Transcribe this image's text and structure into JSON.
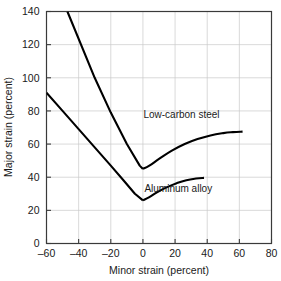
{
  "chart_data": {
    "type": "line",
    "title": "",
    "subtitle": "",
    "xlabel": "Minor strain (percent)",
    "ylabel": "Major strain (percent)",
    "xlim": [
      -60,
      80
    ],
    "ylim": [
      0,
      140
    ],
    "xticks": [
      -60,
      -40,
      -20,
      0,
      20,
      40,
      60,
      80
    ],
    "xtick_labels": [
      "–60",
      "–40",
      "–20",
      "0",
      "20",
      "40",
      "60",
      "80"
    ],
    "yticks": [
      0,
      20,
      40,
      60,
      80,
      100,
      120,
      140
    ],
    "ytick_labels": [
      "0",
      "20",
      "40",
      "60",
      "80",
      "100",
      "120",
      "140"
    ],
    "grid": true,
    "legend": "none",
    "annotations": [
      {
        "text": "Low-carbon steel",
        "x": 24,
        "y": 76
      },
      {
        "text": "Aluminum alloy",
        "x": 22,
        "y": 31
      }
    ],
    "series": [
      {
        "name": "Low-carbon steel",
        "color": "#000000",
        "points": [
          [
            -47,
            140
          ],
          [
            -30,
            100
          ],
          [
            -20,
            79
          ],
          [
            -10,
            60
          ],
          [
            -2,
            47
          ],
          [
            0,
            45
          ],
          [
            4,
            47
          ],
          [
            10,
            51
          ],
          [
            18,
            56
          ],
          [
            26,
            60
          ],
          [
            34,
            63
          ],
          [
            42,
            65.2
          ],
          [
            50,
            66.6
          ],
          [
            56,
            67.2
          ],
          [
            62,
            67.5
          ]
        ]
      },
      {
        "name": "Aluminum alloy",
        "color": "#000000",
        "points": [
          [
            -60,
            91
          ],
          [
            -50,
            80
          ],
          [
            -40,
            69
          ],
          [
            -30,
            58
          ],
          [
            -20,
            47
          ],
          [
            -12,
            38
          ],
          [
            -5,
            30
          ],
          [
            0,
            26
          ],
          [
            4,
            28
          ],
          [
            9,
            31
          ],
          [
            15,
            34
          ],
          [
            21,
            36.4
          ],
          [
            27,
            38.2
          ],
          [
            33,
            39.2
          ],
          [
            38,
            39.6
          ]
        ]
      }
    ]
  }
}
